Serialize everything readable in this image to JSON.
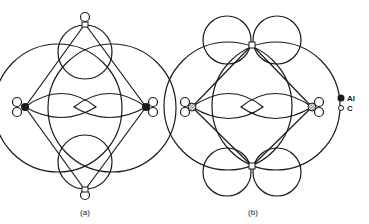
{
  "figure": {
    "panels": [
      {
        "id": "a",
        "caption": "(a)"
      },
      {
        "id": "b",
        "caption": "(b)"
      }
    ],
    "legend": [
      {
        "symbol": "filled-circle",
        "label": "Al"
      },
      {
        "symbol": "open-circle",
        "label": "C"
      }
    ]
  },
  "colors": {
    "stroke": "#1a1a1a",
    "al_fill": "#1a1a1a",
    "al_hatched_fill": "#888888",
    "c_fill": "#ffffff"
  }
}
